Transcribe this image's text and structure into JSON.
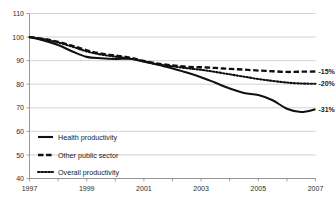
{
  "chart_data": {
    "type": "line",
    "title": "",
    "subtitle": "",
    "xlabel": "",
    "ylabel": "",
    "xlim": [
      1997,
      2007
    ],
    "ylim": [
      40,
      110
    ],
    "grid": true,
    "legend_position": "inside-bottom-left",
    "y_ticks": [
      40,
      50,
      60,
      70,
      80,
      90,
      100,
      110
    ],
    "y_tick_labels": [
      "40",
      "50",
      "60",
      "70",
      "80",
      "90",
      "100",
      "110"
    ],
    "x_ticks": [
      1997,
      1998,
      1999,
      2000,
      2001,
      2002,
      2003,
      2004,
      2005,
      2006,
      2007
    ],
    "x_tick_labels": [
      "1997",
      "",
      "1999",
      "",
      "2001",
      "",
      "2003",
      "",
      "2005",
      "",
      "2007"
    ],
    "x": [
      1997,
      1997.5,
      1998,
      1998.5,
      1999,
      1999.5,
      2000,
      2000.5,
      2001,
      2001.5,
      2002,
      2002.5,
      2003,
      2003.5,
      2004,
      2004.5,
      2005,
      2005.5,
      2006,
      2006.5,
      2007
    ],
    "series": [
      {
        "name": "Health productivity",
        "style": "solid",
        "color": "#111111",
        "end_label": "-31%",
        "values": [
          100,
          98.6,
          96.6,
          93.9,
          91.6,
          91.0,
          90.7,
          90.8,
          89.7,
          88.3,
          86.7,
          85.0,
          83.0,
          80.6,
          78.2,
          76.3,
          75.4,
          73.2,
          69.6,
          68.2,
          69.4
        ]
      },
      {
        "name": "Other public sector",
        "style": "dashed",
        "color": "#111111",
        "end_label": "-15%",
        "values": [
          100,
          99.2,
          98.0,
          96.3,
          94.4,
          93.0,
          92.2,
          91.3,
          89.9,
          88.7,
          88.0,
          87.4,
          87.2,
          86.9,
          86.5,
          86.2,
          85.8,
          85.5,
          85.2,
          85.3,
          85.4
        ]
      },
      {
        "name": "Overall productivity",
        "style": "dotted",
        "color": "#111111",
        "end_label": "-20%",
        "values": [
          100,
          99.1,
          97.7,
          95.9,
          93.9,
          92.6,
          91.7,
          90.9,
          89.6,
          88.4,
          87.6,
          86.8,
          86.1,
          85.2,
          84.2,
          83.2,
          82.2,
          81.4,
          80.7,
          80.3,
          80.2
        ]
      }
    ]
  },
  "legend": {
    "items": [
      {
        "label": "Health productivity",
        "style": "solid"
      },
      {
        "label": "Other public sector",
        "style": "dashed"
      },
      {
        "label": "Overall productivity",
        "style": "dotted"
      }
    ]
  },
  "colors": {
    "background": "#ffffff",
    "gridline": "#bfbfbf",
    "axis": "#8c8c8c",
    "line": "#111111",
    "text": "#1a1a1a"
  }
}
